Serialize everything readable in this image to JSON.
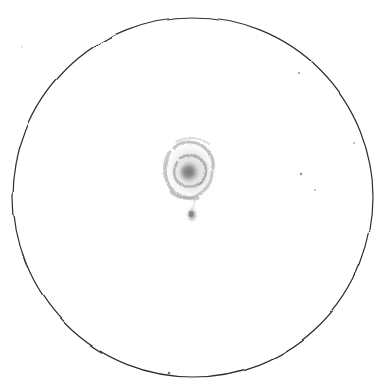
{
  "sketch": {
    "medium": "pencil-on-white-paper",
    "background_color": "#ffffff",
    "ink_color": "#2b2b2b",
    "graphite_color": "#8a8a8a",
    "canvas": {
      "width": 386,
      "height": 392
    }
  },
  "field_of_view": {
    "shape": "circle",
    "center_x": 193,
    "center_y": 197,
    "radius": 180,
    "stroke_color": "#2e2e2e",
    "stroke_width": 1.2,
    "fill": "#ffffff"
  },
  "objects": [
    {
      "name": "main-galaxy",
      "label": "spiral galaxy",
      "center_x": 191,
      "center_y": 171,
      "radius_x": 26,
      "radius_y": 30,
      "rotation": -12,
      "core_x": 189,
      "core_y": 172,
      "core_radius": 11,
      "core_tone": "#7d7d7d",
      "halo_tone": "#b8b8b8",
      "arm_tone": "#9a9a9a"
    },
    {
      "name": "companion-galaxy",
      "label": "companion",
      "center_x": 192,
      "center_y": 215,
      "radius_x": 5,
      "radius_y": 7,
      "core_tone": "#8e8e8e",
      "halo_tone": "#cfcfcf"
    }
  ],
  "stars": [
    {
      "x": 299,
      "y": 73,
      "r": 1.1,
      "tone": "#9c9c9c"
    },
    {
      "x": 354,
      "y": 143,
      "r": 1.0,
      "tone": "#a8a8a8"
    },
    {
      "x": 301,
      "y": 174,
      "r": 1.2,
      "tone": "#8f8f8f"
    },
    {
      "x": 315,
      "y": 190,
      "r": 0.9,
      "tone": "#b0b0b0"
    },
    {
      "x": 22,
      "y": 47,
      "r": 0.8,
      "tone": "#c4c4c4"
    },
    {
      "x": 169,
      "y": 373,
      "r": 1.3,
      "tone": "#6f6f6f"
    }
  ],
  "spiral_arms": [
    {
      "name": "arm-upper-left",
      "path": "M 174 148 C 181 140, 196 140, 205 148 C 212 154, 214 162, 213 169",
      "tone": "#9a9a9a",
      "width": 3.1
    },
    {
      "name": "arm-outer-left",
      "path": "M 170 152 C 163 161, 163 176, 170 187 C 176 196, 188 200, 198 198",
      "tone": "#a4a4a4",
      "width": 3.4
    },
    {
      "name": "arm-lower-right",
      "path": "M 212 172 C 212 182, 206 191, 196 196 C 187 200, 177 198, 171 192",
      "tone": "#a0a0a0",
      "width": 3.0
    },
    {
      "name": "arm-inner-sweep",
      "path": "M 180 158 C 188 153, 199 155, 204 163 C 208 170, 206 179, 199 184",
      "tone": "#8d8d8d",
      "width": 2.6
    },
    {
      "name": "arm-inner-lower",
      "path": "M 202 182 C 195 188, 184 188, 178 182 C 173 177, 173 169, 177 163",
      "tone": "#909090",
      "width": 2.5
    },
    {
      "name": "arm-wisp-top",
      "path": "M 176 142 C 186 136, 200 137, 209 144",
      "tone": "#bdbdbd",
      "width": 2.2
    },
    {
      "name": "arm-bridge",
      "path": "M 195 198 C 194 204, 193 208, 192 211",
      "tone": "#c6c6c6",
      "width": 2.0
    }
  ]
}
